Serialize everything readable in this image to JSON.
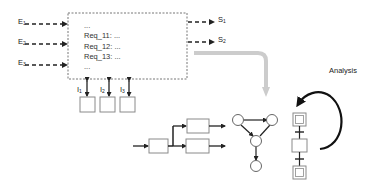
{
  "inputs": [
    {
      "base": "E",
      "sub": "1"
    },
    {
      "base": "E",
      "sub": "2"
    },
    {
      "base": "E",
      "sub": "3"
    }
  ],
  "outputs": [
    {
      "base": "S",
      "sub": "1"
    },
    {
      "base": "S",
      "sub": "2"
    }
  ],
  "interfaces": [
    {
      "base": "I",
      "sub": "1"
    },
    {
      "base": "I",
      "sub": "2"
    },
    {
      "base": "I",
      "sub": "3"
    }
  ],
  "requirements": [
    "...",
    "Req_11: ...",
    "Req_12: ...",
    "Req_13: ...",
    "..."
  ],
  "analysis_label": "Analysis",
  "colors": {
    "line": "#222222",
    "box_border": "#8a8a8a",
    "dashed_border": "#777777",
    "flow_arrow": "#cccccc"
  }
}
